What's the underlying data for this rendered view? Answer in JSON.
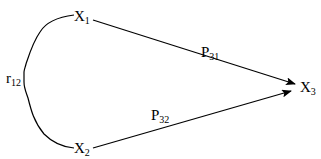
{
  "diagram": {
    "type": "path-diagram",
    "nodes": [
      {
        "id": "x1",
        "main": "X",
        "sub": "1"
      },
      {
        "id": "x2",
        "main": "X",
        "sub": "2"
      },
      {
        "id": "x3",
        "main": "X",
        "sub": "3"
      }
    ],
    "edges": [
      {
        "from": "x1",
        "to": "x3",
        "type": "arrow",
        "label_main": "P",
        "label_sub": "31"
      },
      {
        "from": "x2",
        "to": "x3",
        "type": "arrow",
        "label_main": "P",
        "label_sub": "32"
      },
      {
        "from": "x1",
        "to": "x2",
        "type": "curved-correlation",
        "label_main": "r",
        "label_sub": "12"
      }
    ],
    "colors": {
      "line": "#000000",
      "background": "#ffffff"
    }
  }
}
